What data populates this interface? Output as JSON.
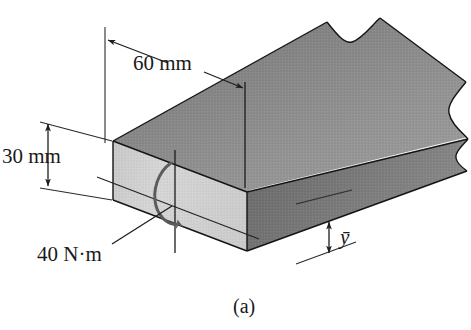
{
  "figure": {
    "caption": "(a)",
    "kind": "3d-rectangular-beam-cross-section-diagram",
    "labels": {
      "width_dim": "60 mm",
      "height_dim": "30 mm",
      "torque_label": "40 N·m",
      "centroid_label": "ȳ"
    },
    "colors": {
      "top_face": "#8d8d8d",
      "side_face": "#717171",
      "front_face": "#d2d2d2",
      "outline": "#141414",
      "dimension_line": "#1d1d1d",
      "torque_arrow": "#5c5c5c",
      "background": "#ffffff",
      "text": "#1a1a1a"
    },
    "geometry_notes": {
      "width_dim_value_mm": 60,
      "height_dim_value_mm": 30,
      "torque_value_N_m": 40,
      "break_line": "wavy-break-at-right-end"
    }
  }
}
